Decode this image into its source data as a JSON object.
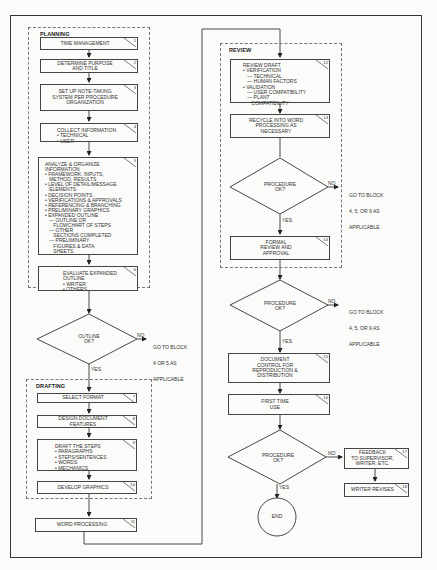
{
  "groups": {
    "planning": "PLANNING",
    "drafting": "DRAFTING",
    "review": "REVIEW"
  },
  "blocks": [
    {
      "num": "1",
      "lines": [
        "TIME MANAGEMENT"
      ]
    },
    {
      "num": "2",
      "lines": [
        "DETERMINE PURPOSE",
        "AND TITLE"
      ]
    },
    {
      "num": "3",
      "lines": [
        "SET UP NOTE-TAKING",
        "SYSTEM PER PROCEDURE",
        "ORGANIZATION"
      ]
    },
    {
      "num": "4",
      "lines": [
        "COLLECT INFORMATION",
        "• TECHNICAL",
        "• USER"
      ]
    },
    {
      "num": "5",
      "lines": [
        "ANALYZE & ORGANIZE",
        "INFORMATION",
        "• FRAMEWORK: INPUTS,",
        "   METHOD, RESULTS",
        "• LEVEL OF DETAIL/MESSAGE",
        "   ELEMENTS",
        "• DECISION POINTS",
        "• VERIFICATIONS & APPROVALS",
        "• REFERENCING & BRANCHING",
        "• PRELIMINARY GRAPHICS",
        "• EXPANDED OUTLINE",
        "   — OUTLINE OR",
        "      FLOWCHART OF STEPS",
        "   — OTHER",
        "      SECTIONS COMPLETED",
        "   — PRELIMINARY",
        "      FIGURES & DATA",
        "      SHEETS"
      ]
    },
    {
      "num": "6",
      "lines": [
        "EVALUATE EXPANDED",
        "OUTLINE",
        "• WRITER",
        "• OTHERS"
      ]
    },
    {
      "num": "7",
      "lines": [
        "SELECT FORMAT"
      ]
    },
    {
      "num": "8",
      "lines": [
        "DESIGN DOCUMENT",
        "FEATURES"
      ]
    },
    {
      "num": "9",
      "lines": [
        "DRAFT THE STEPS",
        "• PARAGRAPHS",
        "• STEPS/SENTENCES",
        "• WORDS",
        "• MECHANICS"
      ]
    },
    {
      "num": "10",
      "lines": [
        "DEVELOP GRAPHICS"
      ]
    },
    {
      "num": "11",
      "lines": [
        "WORD PROCESSING"
      ]
    },
    {
      "num": "12",
      "lines": [
        "REVIEW DRAFT",
        "• VERIFICATION",
        "   — TECHNICAL",
        "   — HUMAN FACTORS",
        "• VALIDATION",
        "   — USER COMPATIBILITY",
        "   — PLANT",
        "      COMPATIBILITY"
      ]
    },
    {
      "num": "13",
      "lines": [
        "RECYCLE INTO WORD",
        "PROCESSING AS",
        "NECESSARY"
      ]
    },
    {
      "num": "14",
      "lines": [
        "FORMAL",
        "REVIEW AND",
        "APPROVAL"
      ]
    },
    {
      "num": "15",
      "lines": [
        "DOCUMENT",
        "CONTROL FOR",
        "REPRODUCTION &",
        "DISTRIBUTION"
      ]
    },
    {
      "num": "16",
      "lines": [
        "FIRST TIME",
        "USE"
      ]
    },
    {
      "num": "17",
      "lines": [
        "FEEDBACK",
        "TO SUPERVISOR,",
        "WRITER, ETC."
      ]
    },
    {
      "num": "18",
      "lines": [
        "WRITER REVISES"
      ]
    }
  ],
  "decisions": [
    {
      "lines": [
        "OUTLINE",
        "OK?"
      ],
      "no_label": "NO",
      "yes_label": "YES",
      "no_target": [
        "GO TO BLOCK",
        "4 OR 5 AS",
        "APPLICABLE"
      ]
    },
    {
      "lines": [
        "PROCEDURE",
        "OK?"
      ],
      "no_label": "NO",
      "yes_label": "YES",
      "no_target": [
        "GO TO BLOCK",
        "4, 5, OR 9 AS",
        "APPLICABLE"
      ]
    },
    {
      "lines": [
        "PROCEDURE",
        "OK?"
      ],
      "no_label": "NO",
      "yes_label": "YES",
      "no_target": [
        "GO TO BLOCK",
        "4, 5, OR 9 AS",
        "APPLICABLE"
      ]
    },
    {
      "lines": [
        "PROCEDURE",
        "OK?"
      ],
      "no_label": "NO",
      "yes_label": "YES"
    }
  ],
  "terminal": {
    "label": "END"
  }
}
